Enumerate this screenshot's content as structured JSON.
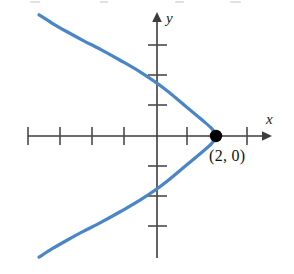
{
  "figure": {
    "name": "leftward-opening-parabola-graph",
    "background_color": "#ffffff"
  },
  "labels": {
    "x_axis": "x",
    "y_axis": "y",
    "vertex_point": "(2, 0)"
  },
  "colors": {
    "curve": "#4a86c5",
    "axis": "#3c3c3c",
    "tick": "#4a4a4a",
    "point": "#000000",
    "text": "#111111"
  },
  "chart_data": {
    "type": "line",
    "title": "",
    "subtitle": "",
    "xlabel": "x",
    "ylabel": "y",
    "grid": false,
    "legend": "none",
    "axis_arrows": {
      "x": "right",
      "y": "up"
    },
    "xlim": [
      -4.2,
      3.6
    ],
    "ylim": [
      -4.0,
      4.0
    ],
    "x_tick_values": [
      -4,
      -3,
      -2,
      -1,
      1,
      2
    ],
    "y_tick_values": [
      3,
      2,
      1,
      -1,
      -2,
      -3
    ],
    "tick_labels_shown": false,
    "annotations": [
      {
        "text": "(2, 0)",
        "x": 2,
        "y": 0,
        "marker": "filled-circle",
        "position": "below-right"
      }
    ],
    "series": [
      {
        "name": "parabola",
        "equation": "x = 2 - y^2/4",
        "opens": "left",
        "vertex": [
          2,
          0
        ],
        "color": "#4a86c5",
        "x": [
          -4.0,
          -3.55,
          -3.05,
          -2.5,
          -1.9,
          -1.25,
          -0.55,
          0.2,
          0.95,
          1.5,
          1.85,
          2.0,
          1.85,
          1.5,
          0.95,
          0.2,
          -0.55,
          -1.25,
          -1.9,
          -2.5,
          -3.05,
          -3.55,
          -4.0
        ],
        "y": [
          4.0,
          3.72,
          3.44,
          3.15,
          2.85,
          2.5,
          2.1,
          1.6,
          1.0,
          0.55,
          0.25,
          0.0,
          -0.25,
          -0.55,
          -1.0,
          -1.6,
          -2.1,
          -2.5,
          -2.85,
          -3.15,
          -3.44,
          -3.72,
          -4.0
        ]
      }
    ]
  }
}
